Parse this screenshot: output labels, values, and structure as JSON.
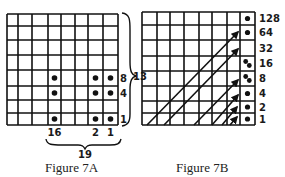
{
  "figure_a": {
    "caption": "Figure 7A",
    "grid": {
      "rows": 8,
      "cols": 8,
      "x_lines": [
        7,
        18,
        32,
        48,
        61,
        75,
        88,
        103,
        118
      ],
      "y_lines": [
        14,
        26,
        40,
        55,
        70,
        86,
        100,
        113,
        125
      ]
    },
    "dots": [
      {
        "row": 4,
        "col": 3
      },
      {
        "row": 4,
        "col": 6
      },
      {
        "row": 4,
        "col": 7
      },
      {
        "row": 5,
        "col": 3
      },
      {
        "row": 5,
        "col": 6
      },
      {
        "row": 5,
        "col": 7
      },
      {
        "row": 7,
        "col": 3
      },
      {
        "row": 7,
        "col": 6
      },
      {
        "row": 7,
        "col": 7
      }
    ],
    "row_labels": [
      {
        "text": "8",
        "row": 4
      },
      {
        "text": "4",
        "row": 5
      },
      {
        "text": "1",
        "row": 7
      }
    ],
    "col_labels": [
      {
        "text": "16",
        "col": 3
      },
      {
        "text": "2",
        "col": 6
      },
      {
        "text": "1",
        "col": 7
      }
    ],
    "row_sum_label": "13",
    "col_sum_label": "19"
  },
  "figure_b": {
    "caption": "Figure 7B",
    "grid": {
      "rows": 8,
      "cols": 8,
      "x_lines": [
        142,
        157,
        170,
        184,
        199,
        212,
        227,
        240,
        255
      ],
      "y_lines": [
        12,
        25,
        40,
        56,
        71,
        86,
        101,
        113,
        125
      ]
    },
    "row_labels": [
      "128",
      "64",
      "32",
      "16",
      "8",
      "4",
      "2",
      "1"
    ],
    "dots": [
      {
        "row": 0,
        "count": 1
      },
      {
        "row": 1,
        "count": 1
      },
      {
        "row": 3,
        "count": 2
      },
      {
        "row": 4,
        "count": 2
      },
      {
        "row": 5,
        "count": 1
      },
      {
        "row": 6,
        "count": 1
      },
      {
        "row": 7,
        "count": 1
      }
    ],
    "arrows": [
      {
        "x1": 147,
        "y1": 125,
        "x2": 238,
        "y2": 32
      },
      {
        "x1": 164,
        "y1": 125,
        "x2": 238,
        "y2": 49
      },
      {
        "x1": 194,
        "y1": 125,
        "x2": 238,
        "y2": 80
      },
      {
        "x1": 212,
        "y1": 125,
        "x2": 238,
        "y2": 95
      },
      {
        "x1": 222,
        "y1": 125,
        "x2": 237,
        "y2": 107
      },
      {
        "x1": 230,
        "y1": 125,
        "x2": 237,
        "y2": 117
      }
    ]
  }
}
